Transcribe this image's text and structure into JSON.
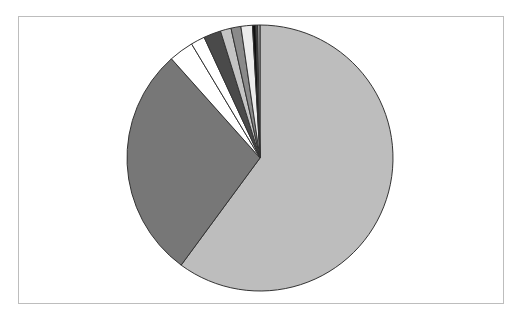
{
  "chart_data": {
    "type": "pie",
    "title": "",
    "legend": "none",
    "start_angle_deg": 0,
    "direction": "clockwise",
    "slices": [
      {
        "label": "",
        "value": 60.1,
        "color": "#bdbdbd"
      },
      {
        "label": "",
        "value": 28.3,
        "color": "#777777"
      },
      {
        "label": "",
        "value": 3.0,
        "color": "#ffffff"
      },
      {
        "label": "",
        "value": 1.7,
        "color": "#ffffff"
      },
      {
        "label": "",
        "value": 2.1,
        "color": "#4a4a4a"
      },
      {
        "label": "",
        "value": 1.3,
        "color": "#c4c4c4"
      },
      {
        "label": "",
        "value": 1.2,
        "color": "#8a8a8a"
      },
      {
        "label": "",
        "value": 1.4,
        "color": "#ececec"
      },
      {
        "label": "",
        "value": 0.4,
        "color": "#111111"
      },
      {
        "label": "",
        "value": 0.2,
        "color": "#555555"
      },
      {
        "label": "",
        "value": 0.3,
        "color": "#9a9a9a"
      }
    ],
    "values": [
      60.1,
      28.3,
      3.0,
      1.7,
      2.1,
      1.3,
      1.2,
      1.4,
      0.4,
      0.2,
      0.3
    ],
    "categories": [
      "",
      "",
      "",
      "",
      "",
      "",
      "",
      "",
      "",
      "",
      ""
    ]
  },
  "style": {
    "frame_border": "#bdbdbd",
    "slice_stroke": "#333333",
    "center_x": 260,
    "center_y": 158,
    "radius": 133
  }
}
